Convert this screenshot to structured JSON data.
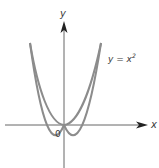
{
  "diagram": {
    "type": "function-graph",
    "curve_label": "y = x",
    "curve_label_exponent": "2",
    "x_axis_label": "x",
    "y_axis_label": "y",
    "origin_label": "0",
    "colors": {
      "curve": "#8c8c8c",
      "axes": "#333333",
      "text": "#3a3a3a"
    }
  }
}
